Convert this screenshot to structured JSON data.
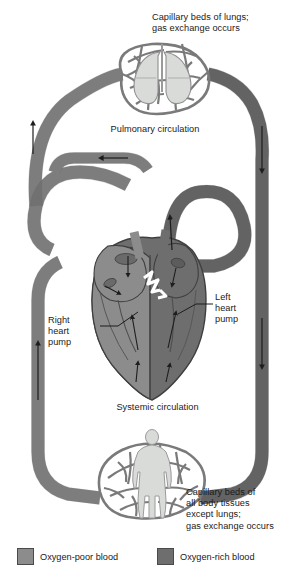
{
  "figure": {
    "type": "diagram"
  },
  "labels": {
    "lungs_capillary": "Capillary beds of lungs;\ngas exchange occurs",
    "pulmonary_circulation": "Pulmonary circulation",
    "right_heart_pump": "Right\nheart\npump",
    "left_heart_pump": "Left\nheart\npump",
    "systemic_circulation": "Systemic circulation",
    "body_capillary": "Capillary beds of\nall body tissues\nexcept lungs;\ngas exchange occurs"
  },
  "legend": {
    "items": [
      {
        "label": "Oxygen-poor blood",
        "color": "#8c8c8c"
      },
      {
        "label": "Oxygen-rich blood",
        "color": "#6e6e6e"
      }
    ]
  },
  "colors": {
    "oxygen_poor": "#8c8c8c",
    "oxygen_rich": "#6e6e6e",
    "vessel_outline": "#3f3f3f",
    "organ_fill": "#d9dbd9",
    "organ_outline": "#8f8f8f",
    "background": "#ffffff",
    "text": "#1a1a1a"
  },
  "icons": {
    "lungs": "lungs-icon",
    "body": "human-body-icon",
    "heart": "heart-icon",
    "flow_arrow": "flow-arrow-icon"
  }
}
